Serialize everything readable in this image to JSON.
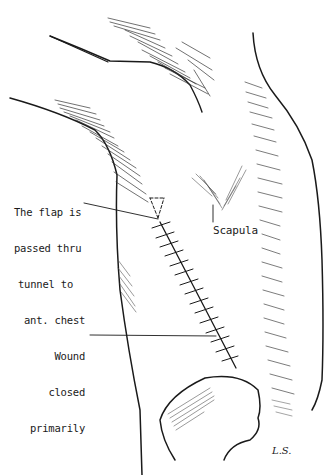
{
  "figure": {
    "type": "medical-illustration",
    "line_color": "#1a1a1a",
    "background": "#ffffff"
  },
  "labels": {
    "flap": {
      "lines": [
        "The flap is",
        "passed thru",
        "tunnel to",
        "ant. chest"
      ]
    },
    "scapula": "Scapula",
    "wound": {
      "lines": [
        "Wound",
        "closed",
        "primarily"
      ]
    }
  },
  "signature": "L.S."
}
